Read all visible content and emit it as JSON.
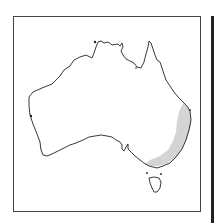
{
  "map": {
    "title": "Australia distribution map",
    "region": "Australia",
    "shaded_range": "South-eastern Australia (eastern Queensland, New South Wales, Victoria)",
    "colors": {
      "outline": "#222222",
      "shaded": "#d4d4d4",
      "frame": "#444444",
      "background": "#ffffff"
    }
  }
}
